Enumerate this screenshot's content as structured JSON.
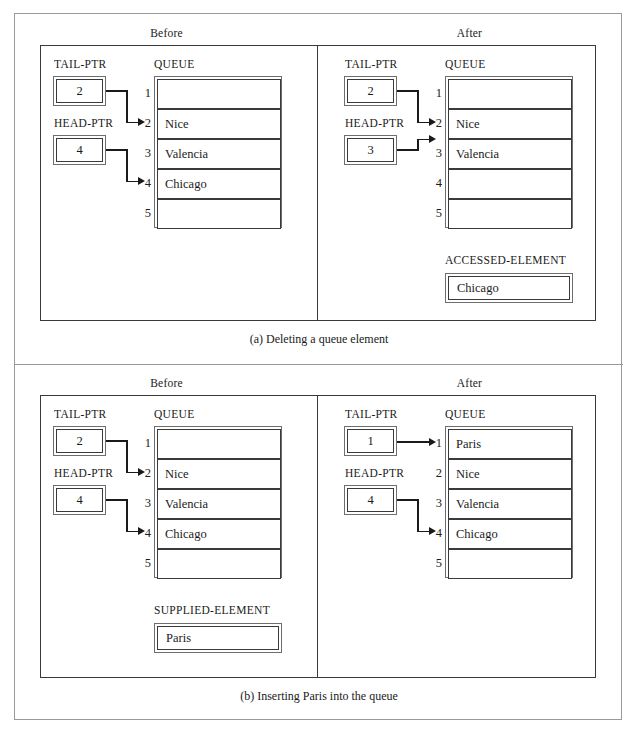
{
  "figure": {
    "sections": [
      {
        "id": "a",
        "caption": "(a) Deleting a queue element",
        "columns": [
          {
            "heading": "Before",
            "tail_ptr": {
              "label": "TAIL-PTR",
              "value": "2"
            },
            "head_ptr": {
              "label": "HEAD-PTR",
              "value": "4"
            },
            "queue": {
              "label": "QUEUE",
              "rows": [
                {
                  "index": "1",
                  "value": ""
                },
                {
                  "index": "2",
                  "value": "Nice"
                },
                {
                  "index": "3",
                  "value": "Valencia"
                },
                {
                  "index": "4",
                  "value": "Chicago"
                },
                {
                  "index": "5",
                  "value": ""
                }
              ]
            },
            "element_box": null
          },
          {
            "heading": "After",
            "tail_ptr": {
              "label": "TAIL-PTR",
              "value": "2"
            },
            "head_ptr": {
              "label": "HEAD-PTR",
              "value": "3"
            },
            "queue": {
              "label": "QUEUE",
              "rows": [
                {
                  "index": "1",
                  "value": ""
                },
                {
                  "index": "2",
                  "value": "Nice"
                },
                {
                  "index": "3",
                  "value": "Valencia"
                },
                {
                  "index": "4",
                  "value": ""
                },
                {
                  "index": "5",
                  "value": ""
                }
              ]
            },
            "element_box": {
              "label": "ACCESSED-ELEMENT",
              "value": "Chicago"
            }
          }
        ]
      },
      {
        "id": "b",
        "caption": "(b) Inserting Paris into the queue",
        "columns": [
          {
            "heading": "Before",
            "tail_ptr": {
              "label": "TAIL-PTR",
              "value": "2"
            },
            "head_ptr": {
              "label": "HEAD-PTR",
              "value": "4"
            },
            "queue": {
              "label": "QUEUE",
              "rows": [
                {
                  "index": "1",
                  "value": ""
                },
                {
                  "index": "2",
                  "value": "Nice"
                },
                {
                  "index": "3",
                  "value": "Valencia"
                },
                {
                  "index": "4",
                  "value": "Chicago"
                },
                {
                  "index": "5",
                  "value": ""
                }
              ]
            },
            "element_box": {
              "label": "SUPPLIED-ELEMENT",
              "value": "Paris"
            }
          },
          {
            "heading": "After",
            "tail_ptr": {
              "label": "TAIL-PTR",
              "value": "1"
            },
            "head_ptr": {
              "label": "HEAD-PTR",
              "value": "4"
            },
            "queue": {
              "label": "QUEUE",
              "rows": [
                {
                  "index": "1",
                  "value": "Paris"
                },
                {
                  "index": "2",
                  "value": "Nice"
                },
                {
                  "index": "3",
                  "value": "Valencia"
                },
                {
                  "index": "4",
                  "value": "Chicago"
                },
                {
                  "index": "5",
                  "value": ""
                }
              ]
            },
            "element_box": null
          }
        ]
      }
    ]
  }
}
